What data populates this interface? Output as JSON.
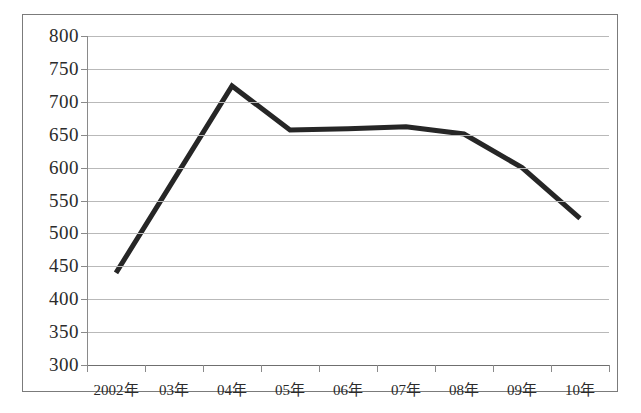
{
  "chart_data": {
    "type": "line",
    "title": "",
    "subtitle": "",
    "xlabel": "",
    "ylabel": "",
    "categories": [
      "2002年",
      "03年",
      "04年",
      "05年",
      "06年",
      "07年",
      "08年",
      "09年",
      "10年"
    ],
    "values": [
      440,
      582,
      724,
      657,
      659,
      662,
      651,
      600,
      523
    ],
    "series": [
      {
        "name": "",
        "values": [
          440,
          582,
          724,
          657,
          659,
          662,
          651,
          600,
          523
        ]
      }
    ],
    "ylim": [
      300,
      800
    ],
    "ytick_step": 50,
    "yticks": [
      800,
      750,
      700,
      650,
      600,
      550,
      500,
      450,
      400,
      350,
      300
    ],
    "ytick_labels": [
      "800",
      "750",
      "700",
      "650",
      "600",
      "550",
      "500",
      "450",
      "400",
      "350",
      "300"
    ],
    "grid": true,
    "grid_axis": "y",
    "legend": false,
    "legend_position": "none",
    "line_color": "#262626",
    "line_width": 5,
    "markers": false,
    "annotations": []
  },
  "figure": {
    "border_color": "#7b7b7b",
    "background": "#ffffff",
    "grid_color": "#b9b9b9",
    "axis_color": "#8a8a8a",
    "text_color": "#2b2b2b"
  }
}
